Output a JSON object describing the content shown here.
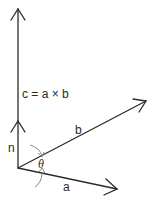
{
  "diagram": {
    "labels": {
      "c": "c = a × b",
      "b": "b",
      "a": "a",
      "n": "n",
      "theta": "θ"
    },
    "colors": {
      "stroke": "#2a2a2a",
      "arc": "#888888",
      "background": "#ffffff"
    },
    "vectors": [
      {
        "name": "c",
        "from": [
          18,
          168
        ],
        "to": [
          18,
          8
        ]
      },
      {
        "name": "n",
        "from": [
          18,
          168
        ],
        "to": [
          18,
          118
        ]
      },
      {
        "name": "b",
        "from": [
          18,
          168
        ],
        "to": [
          146,
          100
        ]
      },
      {
        "name": "a",
        "from": [
          18,
          168
        ],
        "to": [
          117,
          189
        ]
      }
    ]
  }
}
